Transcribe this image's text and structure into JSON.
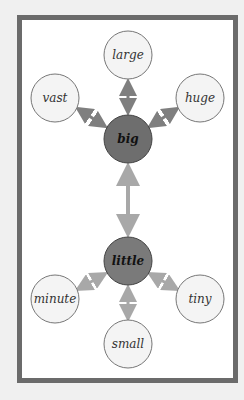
{
  "diagram": {
    "colors": {
      "hub_fill": "#6e6e6e",
      "leaf_fill": "#f4f4f4",
      "arrow": "#7f7f7f",
      "arrow_light": "#a8a8a8",
      "frame": "#6b6b6b"
    },
    "hubs": [
      {
        "id": "big",
        "label": "big",
        "x": 128,
        "y": 139
      },
      {
        "id": "little",
        "label": "little",
        "x": 128,
        "y": 261
      }
    ],
    "leaves": [
      {
        "id": "large",
        "label": "large",
        "x": 128,
        "y": 55,
        "hub": "big"
      },
      {
        "id": "vast",
        "label": "vast",
        "x": 55,
        "y": 98,
        "hub": "big"
      },
      {
        "id": "huge",
        "label": "huge",
        "x": 200,
        "y": 98,
        "hub": "big"
      },
      {
        "id": "minute",
        "label": "minute",
        "x": 55,
        "y": 299,
        "hub": "little"
      },
      {
        "id": "tiny",
        "label": "tiny",
        "x": 200,
        "y": 299,
        "hub": "little"
      },
      {
        "id": "small",
        "label": "small",
        "x": 128,
        "y": 344,
        "hub": "little"
      }
    ]
  }
}
